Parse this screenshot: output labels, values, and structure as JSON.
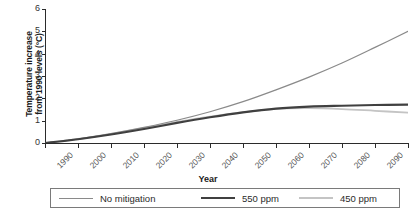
{
  "chart_data": {
    "type": "line",
    "title": "",
    "xlabel": "Year",
    "ylabel": "Temperature increase from 1990 levels (°C)",
    "ylabel_line1": "Temperature increase",
    "ylabel_line2": "from 1990 levels (°C)",
    "xlim": [
      1990,
      2100
    ],
    "ylim": [
      0,
      6
    ],
    "grid": false,
    "legend_position": "bottom",
    "yticks": [
      0,
      1,
      2,
      3,
      4,
      5,
      6
    ],
    "ytick_labels": [
      "0",
      "1",
      "2",
      "3",
      "4",
      "5",
      "6"
    ],
    "x": [
      1990,
      2000,
      2010,
      2020,
      2030,
      2040,
      2050,
      2060,
      2070,
      2080,
      2090,
      2100
    ],
    "xtick_labels": [
      "1990",
      "2000",
      "2010",
      "2020",
      "2030",
      "2040",
      "2050",
      "2060",
      "2070",
      "2080",
      "2090",
      "2100"
    ],
    "series": [
      {
        "name": "No mitigation",
        "color": "#8a8a8a",
        "width": 1.2,
        "values": [
          0.0,
          0.18,
          0.42,
          0.7,
          1.02,
          1.4,
          1.85,
          2.38,
          2.95,
          3.58,
          4.28,
          5.0
        ]
      },
      {
        "name": "550 ppm",
        "color": "#404040",
        "width": 2.1,
        "values": [
          0.0,
          0.17,
          0.38,
          0.63,
          0.9,
          1.15,
          1.37,
          1.54,
          1.63,
          1.67,
          1.7,
          1.72
        ]
      },
      {
        "name": "450 ppm",
        "color": "#c4c4c4",
        "width": 1.8,
        "values": [
          0.0,
          0.18,
          0.41,
          0.67,
          0.94,
          1.18,
          1.38,
          1.53,
          1.56,
          1.52,
          1.44,
          1.36
        ]
      }
    ]
  },
  "legend": {
    "items": [
      {
        "label": "No mitigation"
      },
      {
        "label": "550 ppm"
      },
      {
        "label": "450 ppm"
      }
    ]
  }
}
